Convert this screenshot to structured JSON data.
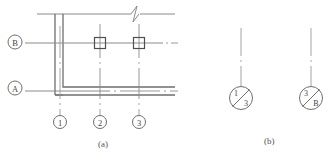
{
  "figure": {
    "title_a": "(a)",
    "title_b": "(b)",
    "colors": {
      "line": "#8a8a8a",
      "wall": "#6e6e6e",
      "center": "#9a9a9a",
      "text": "#555555"
    }
  },
  "plan": {
    "grid_bubbles_horizontal": [
      {
        "label": "B",
        "cx": 15,
        "cy": 42
      },
      {
        "label": "A",
        "cx": 15,
        "cy": 88
      }
    ],
    "grid_bubbles_vertical": [
      {
        "label": "1",
        "cx": 60,
        "cy": 122
      },
      {
        "label": "2",
        "cx": 100,
        "cy": 122
      },
      {
        "label": "3",
        "cx": 139,
        "cy": 122
      }
    ],
    "columns": [
      {
        "name": "column-b2",
        "cx": 100,
        "cy": 43
      },
      {
        "name": "column-b3",
        "cx": 139,
        "cy": 43
      }
    ],
    "break_symbol": {
      "x": 134,
      "y": 14
    }
  },
  "details": [
    {
      "name": "detail-mark-1",
      "top_left": "1",
      "bottom_right": "3",
      "cx": 241,
      "cy": 98
    },
    {
      "name": "detail-mark-2",
      "top_left": "3",
      "bottom_right": "B",
      "cx": 311,
      "cy": 98
    }
  ]
}
